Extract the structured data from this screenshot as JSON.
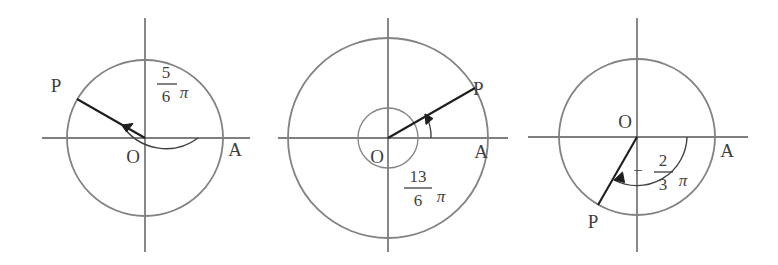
{
  "figure": {
    "type": "math-diagram",
    "background": "#ffffff",
    "circle_color": "#828282",
    "axis_color": "#555555",
    "ray_color": "#1e1e1e",
    "arc_color": "#3f3f3f",
    "label_color": "#3f3f3f"
  },
  "panels": [
    {
      "id": "panel-1",
      "center": {
        "x": 145,
        "y": 138
      },
      "radius": 78,
      "origin_label": "O",
      "terminal_label": "P",
      "initial_label": "A",
      "angle": {
        "numerator": "5",
        "denominator": "6",
        "symbol": "π",
        "sign": "",
        "value_deg": 150,
        "direction": "counterclockwise",
        "revolutions": 0
      },
      "point_p": {
        "x": 77,
        "y": 99
      },
      "has_spiral": false
    },
    {
      "id": "panel-2",
      "center": {
        "x": 388,
        "y": 138
      },
      "radius": 100,
      "inner_radius": 30,
      "origin_label": "O",
      "terminal_label": "P",
      "initial_label": "A",
      "angle": {
        "numerator": "13",
        "denominator": "6",
        "symbol": "π",
        "sign": "",
        "value_deg": 390,
        "direction": "counterclockwise",
        "revolutions": 1
      },
      "point_p": {
        "x": 475,
        "y": 88
      },
      "has_spiral": true
    },
    {
      "id": "panel-3",
      "center": {
        "x": 637,
        "y": 137
      },
      "radius": 78,
      "origin_label": "O",
      "terminal_label": "P",
      "initial_label": "A",
      "angle": {
        "numerator": "2",
        "denominator": "3",
        "symbol": "π",
        "sign": "−",
        "value_deg": -120,
        "direction": "clockwise",
        "revolutions": 0
      },
      "point_p": {
        "x": 598,
        "y": 205
      },
      "has_spiral": false
    }
  ]
}
